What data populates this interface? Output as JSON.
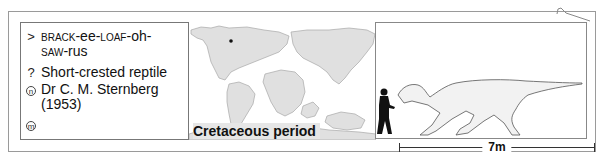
{
  "info": {
    "pronunciation": {
      "symbol": ">",
      "parts": [
        {
          "text": "BRACK",
          "style": "smallcaps"
        },
        {
          "text": "-ee-",
          "style": "normal"
        },
        {
          "text": "LOAF",
          "style": "smallcaps"
        },
        {
          "text": "-oh-",
          "style": "normal"
        },
        {
          "text": "SAW",
          "style": "smallcaps"
        },
        {
          "text": "-rus",
          "style": "normal"
        }
      ]
    },
    "meaning": {
      "symbol": "?",
      "text": "Short-crested reptile"
    },
    "named_by": {
      "symbol": "n",
      "name": "Dr C. M. Sternberg",
      "year": "(1953)"
    },
    "museum": {
      "symbol": "m",
      "text": ""
    }
  },
  "map": {
    "period_label": "Cretaceous period",
    "land_color": "#e0e0e0",
    "outline_color": "#a8a8a8",
    "location_dot_color": "#111111"
  },
  "silhouette": {
    "human_color": "#111111",
    "dinosaur_fill": "#f2f2f2",
    "dinosaur_outline": "#555555"
  },
  "scale": {
    "label": "7m"
  }
}
